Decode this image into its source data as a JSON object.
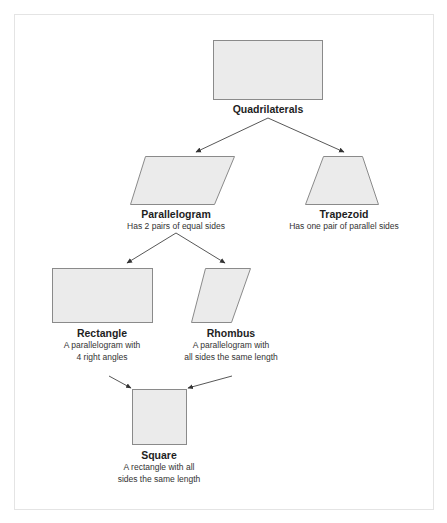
{
  "diagram": {
    "type": "hierarchy",
    "colors": {
      "shape_fill": "#ebebeb",
      "shape_stroke": "#8a8a8a",
      "arrow": "#444444",
      "frame": "#e4e4e4"
    },
    "nodes": {
      "quadrilaterals": {
        "title": "Quadrilaterals",
        "description": "",
        "shape": "rectangle"
      },
      "parallelogram": {
        "title": "Parallelogram",
        "description": "Has 2 pairs of equal sides",
        "shape": "parallelogram"
      },
      "trapezoid": {
        "title": "Trapezoid",
        "description": "Has one pair of parallel sides",
        "shape": "trapezoid"
      },
      "rectangle": {
        "title": "Rectangle",
        "description_line1": "A parallelogram with",
        "description_line2": "4 right angles",
        "shape": "rectangle"
      },
      "rhombus": {
        "title": "Rhombus",
        "description_line1": "A parallelogram with",
        "description_line2": "all sides the same length",
        "shape": "rhombus"
      },
      "square": {
        "title": "Square",
        "description_line1": "A rectangle with all",
        "description_line2": "sides the same length",
        "shape": "square"
      }
    },
    "edges": [
      {
        "from": "quadrilaterals",
        "to": "parallelogram"
      },
      {
        "from": "quadrilaterals",
        "to": "trapezoid"
      },
      {
        "from": "parallelogram",
        "to": "rectangle"
      },
      {
        "from": "parallelogram",
        "to": "rhombus"
      },
      {
        "from": "rectangle",
        "to": "square"
      },
      {
        "from": "rhombus",
        "to": "square"
      }
    ]
  }
}
